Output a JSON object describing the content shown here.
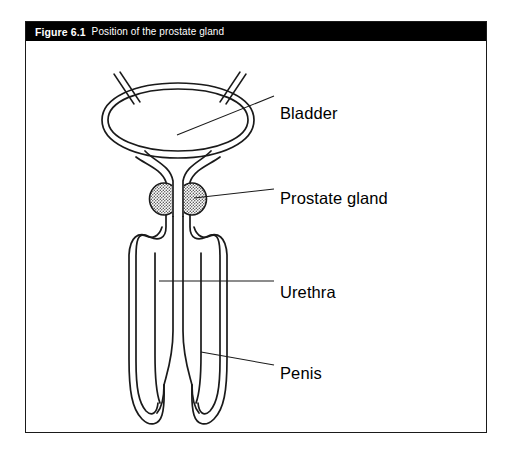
{
  "figure": {
    "number": "Figure 6.1",
    "title": "Position of the prostate gland",
    "caption_bar_color": "#000000",
    "caption_text_color": "#ffffff",
    "border_color": "#1a1a1a",
    "background_color": "#ffffff"
  },
  "diagram": {
    "type": "anatomical-line-drawing",
    "line_color": "#1a1a1a",
    "fill_color": "#ffffff",
    "prostate_fill_color": "#9a9a9a",
    "structures": [
      "bladder",
      "left-ureter",
      "right-ureter",
      "prostate-gland",
      "urethra",
      "penis",
      "corpus-cavernosum-left",
      "corpus-cavernosum-right"
    ]
  },
  "labels": [
    {
      "id": "bladder",
      "text": "Bladder"
    },
    {
      "id": "prostate",
      "text": "Prostate gland"
    },
    {
      "id": "urethra",
      "text": "Urethra"
    },
    {
      "id": "penis",
      "text": "Penis"
    }
  ]
}
